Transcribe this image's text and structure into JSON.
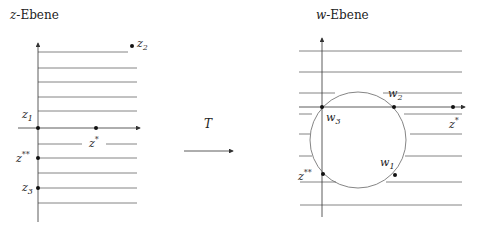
{
  "left_panel": {
    "title": "z-Ebene",
    "title_var": "z",
    "title_rest": "-Ebene",
    "points": {
      "z1": {
        "label": "z",
        "sub": "1"
      },
      "z2": {
        "label": "z",
        "sub": "2"
      },
      "z3": {
        "label": "z",
        "sub": "3"
      },
      "zstar": {
        "label": "z",
        "sup": "*"
      },
      "zstarstar": {
        "label": "z",
        "sup": "**"
      }
    }
  },
  "transform": {
    "label": "T"
  },
  "right_panel": {
    "title": "w-Ebene",
    "title_var": "w",
    "title_rest": "-Ebene",
    "points": {
      "w1": {
        "label": "w",
        "sub": "1"
      },
      "w2": {
        "label": "w",
        "sub": "2"
      },
      "w3": {
        "label": "w",
        "sub": "3"
      },
      "zstar": {
        "label": "z",
        "sup": "*"
      },
      "zstarstar": {
        "label": "z",
        "sup": "**"
      }
    }
  },
  "colors": {
    "line": "#555555",
    "axis": "#333333",
    "dot": "#111111",
    "text": "#222222"
  }
}
